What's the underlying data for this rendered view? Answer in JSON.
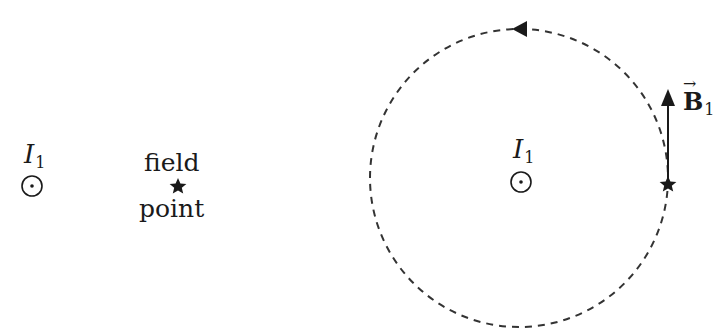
{
  "left_panel": {
    "wire_label": "I",
    "wire_subscript": "1",
    "field_point_line1": "field",
    "field_point_line2": "point"
  },
  "right_panel": {
    "wire_label": "I",
    "wire_subscript": "1",
    "vector_label": "B",
    "vector_subscript": "1",
    "vector_arrow": "→"
  },
  "icons": {
    "current_out_of_page": "circle-dot",
    "field_point_marker": "star",
    "field_line_direction": "counterclockwise-arrow"
  },
  "colors": {
    "ink": "#1a1a1a",
    "dashed_line": "#333333",
    "background": "#ffffff"
  }
}
